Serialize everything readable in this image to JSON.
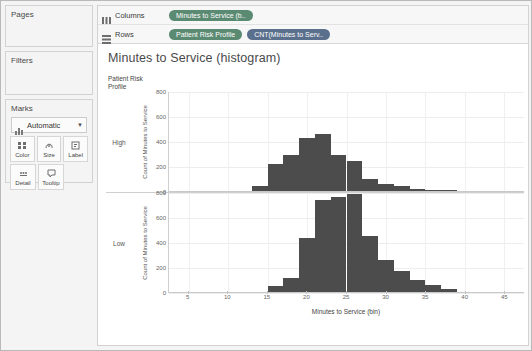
{
  "rail": {
    "pages": {
      "title": "Pages"
    },
    "filters": {
      "title": "Filters"
    },
    "marks": {
      "title": "Marks",
      "mark_type": "Automatic",
      "mark_type_icon": "bar-chart-icon",
      "caret_icon": "chevron-down-icon",
      "buttons": [
        {
          "label": "Color",
          "icon": "color-squares-icon"
        },
        {
          "label": "Size",
          "icon": "size-icon"
        },
        {
          "label": "Label",
          "icon": "label-icon"
        },
        {
          "label": "Detail",
          "icon": "detail-icon"
        },
        {
          "label": "Tooltip",
          "icon": "tooltip-icon"
        }
      ]
    }
  },
  "shelves": [
    {
      "name": "Columns",
      "icon": "columns-icon",
      "pills": [
        {
          "label": "Minutes to Service (b..",
          "color": "#5b8a72"
        }
      ]
    },
    {
      "name": "Rows",
      "icon": "rows-icon",
      "pills": [
        {
          "label": "Patient Risk Profile",
          "color": "#5b8a72"
        },
        {
          "label": "CNT(Minutes to Serv..",
          "color": "#5a6f8c"
        }
      ]
    }
  ],
  "worksheet": {
    "title": "Minutes to Service (histogram)",
    "row_header_title": "Patient Risk\nProfile"
  },
  "chart_data": {
    "type": "bar",
    "title": "Minutes to Service (histogram)",
    "xlabel": "Minutes to Service (bin)",
    "ylabel": "Count of Minutes to Service",
    "xlim": [
      2.5,
      47.5
    ],
    "ylim": [
      0,
      800
    ],
    "xticks": [
      5,
      10,
      15,
      20,
      25,
      30,
      35,
      40,
      45
    ],
    "yticks": [
      0,
      200,
      400,
      600,
      800
    ],
    "bin_width": 2,
    "grid": true,
    "legend": "none",
    "bar_color": "#4c4c4c",
    "panel_label": "Patient Risk Profile",
    "panels": [
      {
        "label": "High",
        "bins": [
          13,
          15,
          17,
          19,
          21,
          23,
          25,
          27,
          29,
          31,
          33,
          35,
          37
        ],
        "values": [
          40,
          215,
          295,
          425,
          460,
          295,
          240,
          100,
          60,
          40,
          20,
          12,
          6
        ]
      },
      {
        "label": "Low",
        "bins": [
          15,
          17,
          19,
          21,
          23,
          25,
          27,
          29,
          31,
          33,
          35,
          37
        ],
        "values": [
          45,
          110,
          440,
          740,
          765,
          790,
          450,
          255,
          170,
          95,
          55,
          25
        ]
      }
    ]
  }
}
